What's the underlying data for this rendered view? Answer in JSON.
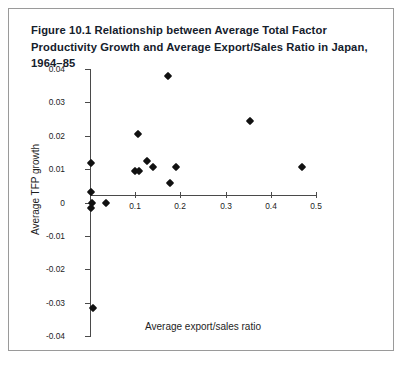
{
  "figure": {
    "title": "Figure 10.1 Relationship between Average Total Factor Productivity Growth and Average Export/Sales Ratio in Japan, 1964–85",
    "frame_color": "#9a9a9a",
    "marker_color": "#111111",
    "axis_color": "#4a4a4a"
  },
  "chart_data": {
    "type": "scatter",
    "title": "Figure 10.1 Relationship between Average Total Factor Productivity Growth and Average Export/Sales Ratio in Japan, 1964–85",
    "xlabel": "Average export/sales ratio",
    "ylabel": "Average TFP growth",
    "xlim": [
      0,
      0.5
    ],
    "ylim": [
      -0.04,
      0.04
    ],
    "xticks": [
      0.1,
      0.2,
      0.3,
      0.4,
      0.5
    ],
    "xtick_labels": [
      "0.1",
      "0.2",
      "0.3",
      "0.4",
      "0.5"
    ],
    "yticks": [
      0.04,
      0.03,
      0.02,
      0.01,
      0,
      -0.01,
      -0.02,
      -0.03,
      -0.04
    ],
    "ytick_labels": [
      "0.04",
      "0.03",
      "0.02",
      "0.01",
      "0",
      "-0.01",
      "-0.02",
      "-0.03",
      "-0.04"
    ],
    "grid": false,
    "legend": false,
    "marker": "diamond",
    "series": [
      {
        "name": "Industries",
        "points": [
          {
            "x": 0.003,
            "y": 0.0118
          },
          {
            "x": 0.003,
            "y": 0.0032
          },
          {
            "x": 0.003,
            "y": -0.0015
          },
          {
            "x": 0.005,
            "y": 0.0
          },
          {
            "x": 0.006,
            "y": -0.0315
          },
          {
            "x": 0.035,
            "y": 0.0
          },
          {
            "x": 0.1,
            "y": 0.0095
          },
          {
            "x": 0.108,
            "y": 0.0095
          },
          {
            "x": 0.107,
            "y": 0.0205
          },
          {
            "x": 0.125,
            "y": 0.0123
          },
          {
            "x": 0.14,
            "y": 0.0105
          },
          {
            "x": 0.172,
            "y": 0.0378
          },
          {
            "x": 0.178,
            "y": 0.0058
          },
          {
            "x": 0.19,
            "y": 0.0105
          },
          {
            "x": 0.355,
            "y": 0.0245
          },
          {
            "x": 0.47,
            "y": 0.0105
          }
        ]
      }
    ]
  }
}
